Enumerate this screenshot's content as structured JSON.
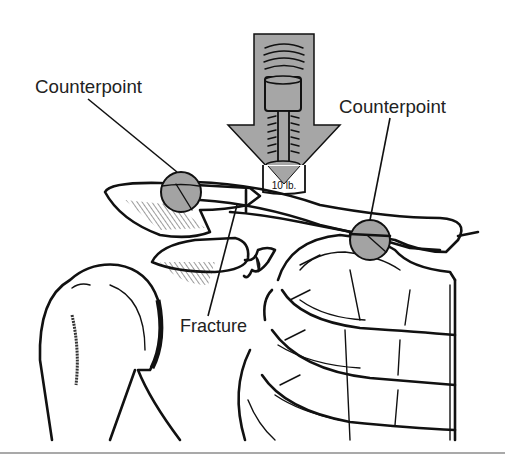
{
  "figure": {
    "type": "medical illustration",
    "labels": {
      "counterpoint_left": "Counterpoint",
      "counterpoint_right": "Counterpoint",
      "fracture": "Fracture"
    },
    "force_gauge": {
      "reading": "10 lb."
    },
    "colors": {
      "arrow_fill": "#a6a6a6",
      "counterpoint_fill": "#a3a3a3",
      "ink": "#111111",
      "background": "#ffffff"
    }
  }
}
